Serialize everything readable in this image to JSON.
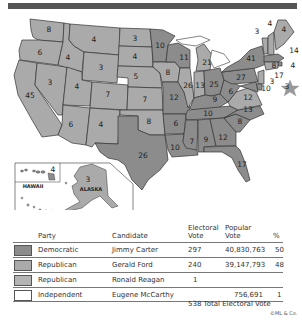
{
  "colors": {
    "democratic": "#8c8c8c",
    "republican": "#aaaaaa",
    "republican_reagan": "#b4b4b4",
    "independent": "#ffffff",
    "border": "#333333",
    "star": "#999999"
  },
  "map": {
    "states": [
      {
        "abbr": "WA",
        "votes": "8",
        "party": "republican"
      },
      {
        "abbr": "OR",
        "votes": "6",
        "party": "republican"
      },
      {
        "abbr": "CA",
        "votes": "45",
        "party": "republican"
      },
      {
        "abbr": "ID",
        "votes": "4",
        "party": "republican"
      },
      {
        "abbr": "NV",
        "votes": "3",
        "party": "republican"
      },
      {
        "abbr": "MT",
        "votes": "4",
        "party": "republican"
      },
      {
        "abbr": "WY",
        "votes": "3",
        "party": "republican"
      },
      {
        "abbr": "UT",
        "votes": "4",
        "party": "republican"
      },
      {
        "abbr": "CO",
        "votes": "7",
        "party": "republican"
      },
      {
        "abbr": "AZ",
        "votes": "6",
        "party": "republican"
      },
      {
        "abbr": "NM",
        "votes": "4",
        "party": "republican"
      },
      {
        "abbr": "ND",
        "votes": "3",
        "party": "republican"
      },
      {
        "abbr": "SD",
        "votes": "4",
        "party": "republican"
      },
      {
        "abbr": "NE",
        "votes": "5",
        "party": "republican"
      },
      {
        "abbr": "KS",
        "votes": "7",
        "party": "republican"
      },
      {
        "abbr": "OK",
        "votes": "8",
        "party": "republican"
      },
      {
        "abbr": "TX",
        "votes": "26",
        "party": "democratic"
      },
      {
        "abbr": "MN",
        "votes": "10",
        "party": "democratic"
      },
      {
        "abbr": "IA",
        "votes": "8",
        "party": "republican"
      },
      {
        "abbr": "MO",
        "votes": "12",
        "party": "democratic"
      },
      {
        "abbr": "AR",
        "votes": "6",
        "party": "democratic"
      },
      {
        "abbr": "LA",
        "votes": "10",
        "party": "democratic"
      },
      {
        "abbr": "WI",
        "votes": "11",
        "party": "democratic"
      },
      {
        "abbr": "IL",
        "votes": "26",
        "party": "republican"
      },
      {
        "abbr": "MI",
        "votes": "21",
        "party": "republican"
      },
      {
        "abbr": "IN",
        "votes": "13",
        "party": "republican"
      },
      {
        "abbr": "OH",
        "votes": "25",
        "party": "democratic"
      },
      {
        "abbr": "KY",
        "votes": "9",
        "party": "democratic"
      },
      {
        "abbr": "TN",
        "votes": "10",
        "party": "democratic"
      },
      {
        "abbr": "MS",
        "votes": "7",
        "party": "democratic"
      },
      {
        "abbr": "AL",
        "votes": "9",
        "party": "democratic"
      },
      {
        "abbr": "GA",
        "votes": "12",
        "party": "democratic"
      },
      {
        "abbr": "FL",
        "votes": "17",
        "party": "democratic"
      },
      {
        "abbr": "SC",
        "votes": "8",
        "party": "democratic"
      },
      {
        "abbr": "NC",
        "votes": "13",
        "party": "democratic"
      },
      {
        "abbr": "VA",
        "votes": "12",
        "party": "republican"
      },
      {
        "abbr": "WV",
        "votes": "6",
        "party": "democratic"
      },
      {
        "abbr": "PA",
        "votes": "27",
        "party": "democratic"
      },
      {
        "abbr": "NY",
        "votes": "41",
        "party": "democratic"
      },
      {
        "abbr": "VT",
        "votes": "3",
        "party": "republican"
      },
      {
        "abbr": "NH",
        "votes": "4",
        "party": "republican"
      },
      {
        "abbr": "ME",
        "votes": "4",
        "party": "republican"
      },
      {
        "abbr": "MA",
        "votes": "14",
        "party": "democratic"
      },
      {
        "abbr": "RI",
        "votes": "4",
        "party": "democratic"
      },
      {
        "abbr": "CT",
        "votes": "8",
        "party": "republican"
      },
      {
        "abbr": "NJ",
        "votes": "17",
        "party": "republican"
      },
      {
        "abbr": "DE",
        "votes": "3",
        "party": "democratic"
      },
      {
        "abbr": "MD",
        "votes": "10",
        "party": "democratic"
      },
      {
        "abbr": "DC",
        "votes": "3",
        "party": "democratic"
      },
      {
        "abbr": "HI",
        "votes": "4",
        "party": "democratic"
      },
      {
        "abbr": "AK",
        "votes": "3",
        "party": "republican"
      }
    ],
    "inset_labels": {
      "hawaii": "HAWAII",
      "alaska": "ALASKA"
    }
  },
  "legend": {
    "headers": {
      "party": "Party",
      "candidate": "Candidate",
      "electoral_vote_line1": "Electoral",
      "electoral_vote_line2": "Vote",
      "popular_vote_line1": "Popular",
      "popular_vote_line2": "Vote",
      "percent": "%"
    },
    "rows": [
      {
        "party": "Democratic",
        "candidate": "Jimmy Carter",
        "electoral": "297",
        "popular": "40,830,763",
        "percent": "50",
        "swatch": "#8c8c8c"
      },
      {
        "party": "Republican",
        "candidate": "Gerald Ford",
        "electoral": "240",
        "popular": "39,147,793",
        "percent": "48",
        "swatch": "#aaaaaa"
      },
      {
        "party": "Republican",
        "candidate": "Ronald Reagan",
        "electoral": "1",
        "popular": "",
        "percent": "",
        "swatch": "#b4b4b4"
      },
      {
        "party": "Independent",
        "candidate": "Eugene McCarthy",
        "electoral": "",
        "popular": "756,691",
        "percent": "1",
        "swatch": "#ffffff"
      }
    ],
    "total": "538 Total Electoral Vote",
    "credit": "©ML & Co."
  }
}
